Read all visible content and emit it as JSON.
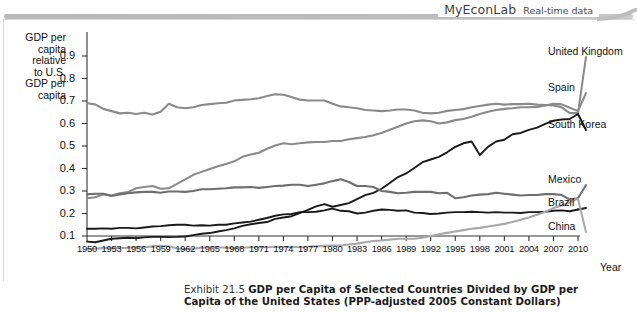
{
  "banner": {
    "brand": "MyEconLab",
    "tagline": "Real-time data"
  },
  "axes": {
    "y_label_lines": [
      "GDP per",
      "capita",
      "relative",
      "to U.S.",
      "GDP per",
      "capita"
    ],
    "y_label_text": "GDP per capita relative to U.S. GDP per capita",
    "x_title": "Year",
    "y_ticks": [
      "0.1",
      "0.2",
      "0.3",
      "0.4",
      "0.5",
      "0.6",
      "0.7",
      "0.8",
      "0.9"
    ],
    "x_ticks": [
      "1950",
      "1953",
      "1956",
      "1959",
      "1962",
      "1965",
      "1968",
      "1971",
      "1974",
      "1977",
      "1980",
      "1983",
      "1986",
      "1989",
      "1992",
      "1995",
      "1998",
      "2001",
      "2004",
      "2007",
      "2010"
    ]
  },
  "caption": {
    "exhibit": "Exhibit 21.5",
    "title_line1": "GDP per Capita of Selected Countries Divided by GDP per Capita",
    "title_line2": "of the United States (PPP-adjusted 2005 Constant Dollars)"
  },
  "chart_data": {
    "type": "line",
    "title": "GDP per Capita of Selected Countries Divided by GDP per Capita of the United States (PPP-adjusted 2005 Constant Dollars)",
    "xlabel": "Year",
    "ylabel": "GDP per capita relative to U.S. GDP per capita",
    "xlim": [
      1950,
      2010
    ],
    "ylim": [
      0.0,
      0.95
    ],
    "grid": false,
    "legend_position": "right-inline",
    "x": [
      1950,
      1951,
      1952,
      1953,
      1954,
      1955,
      1956,
      1957,
      1958,
      1959,
      1960,
      1961,
      1962,
      1963,
      1964,
      1965,
      1966,
      1967,
      1968,
      1969,
      1970,
      1971,
      1972,
      1973,
      1974,
      1975,
      1976,
      1977,
      1978,
      1979,
      1980,
      1981,
      1982,
      1983,
      1984,
      1985,
      1986,
      1987,
      1988,
      1989,
      1990,
      1991,
      1992,
      1993,
      1994,
      1995,
      1996,
      1997,
      1998,
      1999,
      2000,
      2001,
      2002,
      2003,
      2004,
      2005,
      2006,
      2007,
      2008,
      2009,
      2010
    ],
    "series": [
      {
        "name": "United Kingdom",
        "color": "#8a8a8a",
        "values": [
          0.69,
          0.685,
          0.665,
          0.655,
          0.645,
          0.648,
          0.642,
          0.648,
          0.64,
          0.652,
          0.688,
          0.672,
          0.668,
          0.672,
          0.682,
          0.686,
          0.69,
          0.692,
          0.702,
          0.705,
          0.708,
          0.712,
          0.722,
          0.73,
          0.728,
          0.718,
          0.706,
          0.702,
          0.702,
          0.702,
          0.688,
          0.676,
          0.672,
          0.668,
          0.66,
          0.658,
          0.655,
          0.658,
          0.662,
          0.662,
          0.658,
          0.648,
          0.645,
          0.648,
          0.656,
          0.66,
          0.664,
          0.672,
          0.678,
          0.684,
          0.688,
          0.684,
          0.686,
          0.686,
          0.688,
          0.684,
          0.682,
          0.68,
          0.672,
          0.646,
          0.646
        ]
      },
      {
        "name": "Spain",
        "color": "#8a8a8a",
        "values": [
          0.268,
          0.272,
          0.285,
          0.28,
          0.29,
          0.295,
          0.312,
          0.318,
          0.322,
          0.31,
          0.312,
          0.332,
          0.352,
          0.372,
          0.385,
          0.398,
          0.41,
          0.42,
          0.432,
          0.452,
          0.462,
          0.47,
          0.488,
          0.502,
          0.512,
          0.508,
          0.512,
          0.516,
          0.518,
          0.518,
          0.522,
          0.522,
          0.53,
          0.535,
          0.54,
          0.548,
          0.558,
          0.572,
          0.586,
          0.6,
          0.61,
          0.614,
          0.61,
          0.6,
          0.605,
          0.615,
          0.62,
          0.63,
          0.642,
          0.652,
          0.66,
          0.665,
          0.668,
          0.672,
          0.672,
          0.674,
          0.68,
          0.688,
          0.685,
          0.67,
          0.655
        ]
      },
      {
        "name": "South Korea",
        "color": "#1a1a1a",
        "values": [
          0.075,
          0.072,
          0.08,
          0.088,
          0.09,
          0.092,
          0.09,
          0.094,
          0.096,
          0.096,
          0.095,
          0.096,
          0.098,
          0.104,
          0.11,
          0.113,
          0.12,
          0.126,
          0.134,
          0.145,
          0.152,
          0.158,
          0.162,
          0.176,
          0.182,
          0.188,
          0.202,
          0.216,
          0.232,
          0.242,
          0.23,
          0.238,
          0.246,
          0.264,
          0.282,
          0.292,
          0.31,
          0.336,
          0.362,
          0.378,
          0.402,
          0.428,
          0.44,
          0.452,
          0.472,
          0.496,
          0.512,
          0.52,
          0.46,
          0.496,
          0.52,
          0.528,
          0.552,
          0.558,
          0.572,
          0.582,
          0.598,
          0.612,
          0.618,
          0.62,
          0.642
        ]
      },
      {
        "name": "Mexico",
        "color": "#6e6e6e",
        "values": [
          0.285,
          0.288,
          0.288,
          0.278,
          0.285,
          0.29,
          0.294,
          0.296,
          0.296,
          0.292,
          0.298,
          0.298,
          0.296,
          0.3,
          0.308,
          0.308,
          0.31,
          0.312,
          0.316,
          0.316,
          0.318,
          0.314,
          0.318,
          0.322,
          0.324,
          0.328,
          0.328,
          0.322,
          0.328,
          0.334,
          0.344,
          0.352,
          0.34,
          0.322,
          0.322,
          0.318,
          0.3,
          0.296,
          0.29,
          0.292,
          0.296,
          0.296,
          0.296,
          0.29,
          0.292,
          0.268,
          0.272,
          0.28,
          0.284,
          0.286,
          0.292,
          0.288,
          0.284,
          0.28,
          0.282,
          0.282,
          0.286,
          0.286,
          0.282,
          0.262,
          0.268
        ]
      },
      {
        "name": "Brazil",
        "color": "#1a1a1a",
        "values": [
          0.132,
          0.132,
          0.134,
          0.132,
          0.136,
          0.136,
          0.134,
          0.138,
          0.142,
          0.144,
          0.148,
          0.15,
          0.15,
          0.146,
          0.148,
          0.146,
          0.15,
          0.15,
          0.156,
          0.16,
          0.164,
          0.172,
          0.18,
          0.19,
          0.196,
          0.198,
          0.206,
          0.206,
          0.208,
          0.214,
          0.222,
          0.212,
          0.21,
          0.2,
          0.204,
          0.212,
          0.218,
          0.216,
          0.212,
          0.214,
          0.204,
          0.202,
          0.198,
          0.2,
          0.204,
          0.206,
          0.206,
          0.208,
          0.206,
          0.204,
          0.206,
          0.204,
          0.204,
          0.202,
          0.206,
          0.206,
          0.208,
          0.212,
          0.214,
          0.21,
          0.218
        ]
      },
      {
        "name": "China",
        "color": "#a8a8a8",
        "values": [
          0.042,
          0.044,
          0.046,
          0.046,
          0.046,
          0.048,
          0.05,
          0.05,
          0.054,
          0.056,
          0.054,
          0.044,
          0.042,
          0.044,
          0.048,
          0.05,
          0.05,
          0.048,
          0.046,
          0.048,
          0.05,
          0.05,
          0.05,
          0.052,
          0.05,
          0.052,
          0.05,
          0.052,
          0.054,
          0.056,
          0.058,
          0.058,
          0.062,
          0.066,
          0.072,
          0.078,
          0.08,
          0.084,
          0.088,
          0.088,
          0.088,
          0.092,
          0.1,
          0.108,
          0.114,
          0.12,
          0.126,
          0.132,
          0.136,
          0.142,
          0.148,
          0.154,
          0.162,
          0.172,
          0.182,
          0.194,
          0.208,
          0.224,
          0.236,
          0.25,
          0.266
        ]
      }
    ]
  }
}
